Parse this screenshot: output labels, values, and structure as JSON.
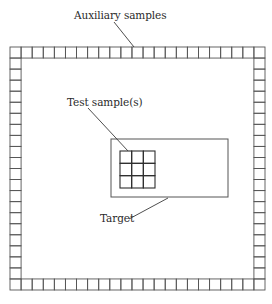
{
  "diagram": {
    "labels": {
      "auxiliary": "Auxiliary samples",
      "test": "Test sample(s)",
      "target": "Target"
    },
    "colors": {
      "frame_stroke": "#555555",
      "grid_stroke": "#2e2e2e",
      "target_stroke": "#555555",
      "leader_stroke": "#3a3a3a",
      "background": "#ffffff"
    },
    "auxiliary_ring": {
      "x": 10,
      "y": 47,
      "width": 255,
      "height": 243,
      "columns": 23,
      "rows": 22
    },
    "target_box": {
      "x": 111,
      "y": 139,
      "width": 117,
      "height": 58
    },
    "test_grid": {
      "x": 120,
      "y": 151,
      "width": 35,
      "height": 37,
      "columns": 3,
      "rows": 3
    },
    "leaders": {
      "auxiliary": {
        "x1": 114,
        "y1": 22,
        "x2": 134,
        "y2": 47
      },
      "test": {
        "x1": 88,
        "y1": 108,
        "x2": 128,
        "y2": 151
      },
      "target": {
        "x1": 129,
        "y1": 219,
        "x2": 168,
        "y2": 198
      }
    },
    "label_positions": {
      "auxiliary": {
        "left": 74,
        "top": 10
      },
      "test": {
        "left": 67,
        "top": 97
      },
      "target": {
        "left": 100,
        "top": 213
      }
    }
  }
}
